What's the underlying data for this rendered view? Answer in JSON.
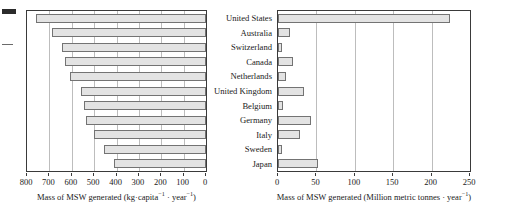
{
  "figure": {
    "categories": [
      "United States",
      "Australia",
      "Switzerland",
      "Canada",
      "Netherlands",
      "United Kingdom",
      "Belgium",
      "Germany",
      "Italy",
      "Sweden",
      "Japan"
    ],
    "bar_fill": "#e3e3e3",
    "bar_stroke": "#737373",
    "axis_color": "#3a3a3a",
    "grid_color": "#bdbdbd"
  },
  "chart_data": [
    {
      "type": "bar",
      "orientation": "horizontal",
      "title": "",
      "xlabel": "Mass of MSW generated (kg·capita⁻¹ · year⁻¹)",
      "xlabel_parts": {
        "main": "Mass of MSW generated (kg·capita",
        "sup1": "−1",
        "mid": " · year",
        "sup2": "−1",
        "end": ")"
      },
      "ylabel": "",
      "xlim": [
        800,
        0
      ],
      "reversed_x": true,
      "ticks": [
        800,
        700,
        600,
        500,
        400,
        300,
        200,
        100,
        0
      ],
      "tick_labels": [
        "800",
        "700",
        "600",
        "500",
        "400",
        "300",
        "200",
        "100",
        "0"
      ],
      "grid": true,
      "categories": [
        "United States",
        "Australia",
        "Switzerland",
        "Canada",
        "Netherlands",
        "United Kingdom",
        "Belgium",
        "Germany",
        "Italy",
        "Sweden",
        "Japan"
      ],
      "values": [
        760,
        690,
        645,
        630,
        610,
        560,
        545,
        535,
        500,
        455,
        410
      ]
    },
    {
      "type": "bar",
      "orientation": "horizontal",
      "title": "",
      "xlabel": "Mass of MSW generated (Million metric tonnes · year⁻¹)",
      "xlabel_parts": {
        "main": "Mass of MSW generated (Million metric tonnes · year",
        "sup1": "−1",
        "mid": "",
        "sup2": "",
        "end": ")"
      },
      "ylabel": "",
      "xlim": [
        0,
        250
      ],
      "reversed_x": false,
      "ticks": [
        0,
        50,
        100,
        150,
        200,
        250
      ],
      "tick_labels": [
        "0",
        "50",
        "100",
        "150",
        "200",
        "250"
      ],
      "grid": true,
      "categories": [
        "United States",
        "Australia",
        "Switzerland",
        "Canada",
        "Netherlands",
        "United Kingdom",
        "Belgium",
        "Germany",
        "Italy",
        "Sweden",
        "Japan"
      ],
      "values": [
        224,
        15,
        5,
        20,
        10,
        34,
        6,
        43,
        29,
        5,
        52
      ]
    }
  ]
}
